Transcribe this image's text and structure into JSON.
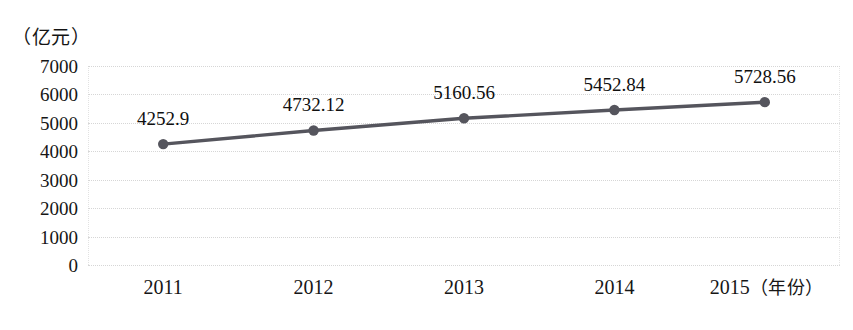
{
  "chart_data": {
    "type": "line",
    "title": "",
    "xlabel": "年份",
    "ylabel": "亿元",
    "y_unit_caption": "（亿元）",
    "x_unit_caption": "（年份）",
    "categories": [
      "2011",
      "2012",
      "2013",
      "2014",
      "2015"
    ],
    "values": [
      4252.9,
      4732.12,
      5160.56,
      5452.84,
      5728.56
    ],
    "point_labels": [
      "4252.9",
      "4732.12",
      "5160.56",
      "5452.84",
      "5728.56"
    ],
    "ylim": [
      0,
      7000
    ],
    "ytick_labels": [
      "7000",
      "6000",
      "5000",
      "4000",
      "3000",
      "2000",
      "1000",
      "0"
    ],
    "ytick_values": [
      7000,
      6000,
      5000,
      4000,
      3000,
      2000,
      1000,
      0
    ],
    "grid": true,
    "grid_style": "dotted",
    "legend": "none",
    "series": [
      {
        "name": "",
        "values": [
          4252.9,
          4732.12,
          5160.56,
          5452.84,
          5728.56
        ],
        "marker": "circle"
      }
    ]
  },
  "colors": {
    "background": "#ffffff",
    "series_line": "#55555d",
    "marker": "#55555d",
    "gridline": "#d6d6d6",
    "text": "#161616"
  }
}
